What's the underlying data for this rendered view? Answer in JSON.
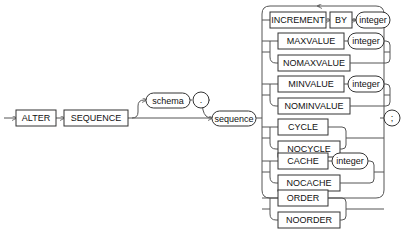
{
  "diagram": {
    "statement": [
      "ALTER",
      "SEQUENCE"
    ],
    "schema": "schema",
    "dot": ".",
    "sequence": "sequence",
    "options": [
      {
        "keyword": "INCREMENT",
        "second": "BY",
        "arg": "integer"
      },
      {
        "keyword": "MAXVALUE",
        "arg": "integer",
        "alt": "NOMAXVALUE"
      },
      {
        "keyword": "MINVALUE",
        "arg": "integer",
        "alt": "NOMINVALUE"
      },
      {
        "keyword": "CYCLE",
        "alt": "NOCYCLE"
      },
      {
        "keyword": "CACHE",
        "arg": "integer",
        "alt": "NOCACHE"
      },
      {
        "keyword": "ORDER",
        "alt": "NOORDER"
      }
    ],
    "terminator": ";"
  }
}
